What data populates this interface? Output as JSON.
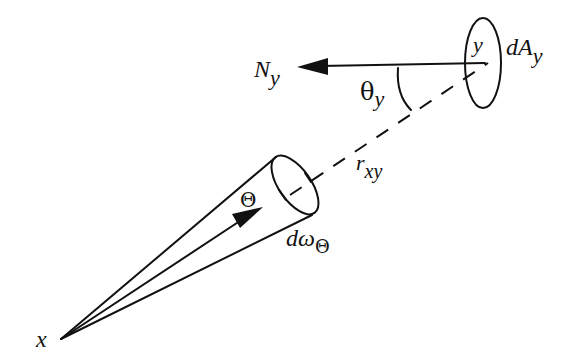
{
  "diagram": {
    "colors": {
      "ink": "#111111",
      "background": "#ffffff"
    },
    "labels": {
      "x_point": {
        "main": "x"
      },
      "normal": {
        "main": "N",
        "sub": "y"
      },
      "point_y": {
        "main": "y"
      },
      "area": {
        "main": "dA",
        "sub": "y"
      },
      "angle": {
        "main": "θ",
        "sub": "y"
      },
      "distance": {
        "main": "r",
        "sub": "xy"
      },
      "direction": {
        "main": "Θ"
      },
      "solid_angle": {
        "main": "dω",
        "sub": "Θ"
      }
    },
    "elements": [
      "cone from x with elliptical cap (solid angle dω_Θ)",
      "direction arrow Θ from x",
      "dashed line r_xy from cone to y",
      "surface element ellipse dA_y at y",
      "normal arrow N_y from y",
      "angle arc θ_y between normal and r_xy"
    ]
  }
}
